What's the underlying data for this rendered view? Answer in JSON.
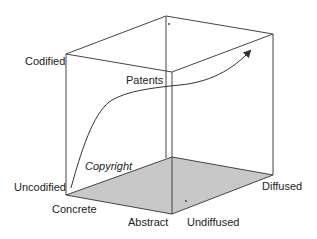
{
  "diagram": {
    "type": "3d-cube",
    "colors": {
      "edge": "#444444",
      "floor": "#c8c8c8",
      "curve": "#333333",
      "text": "#222222"
    },
    "vertical_axis": {
      "top_label": "Codified",
      "bottom_label": "Uncodified"
    },
    "depth_axis": {
      "near_label": "Concrete",
      "far_label": "Abstract"
    },
    "horizontal_axis": {
      "near_label": "Undiffused",
      "far_label": "Diffused"
    },
    "annotations": {
      "curve_top_label": "Patents",
      "curve_bottom_label": "Copyright"
    }
  }
}
